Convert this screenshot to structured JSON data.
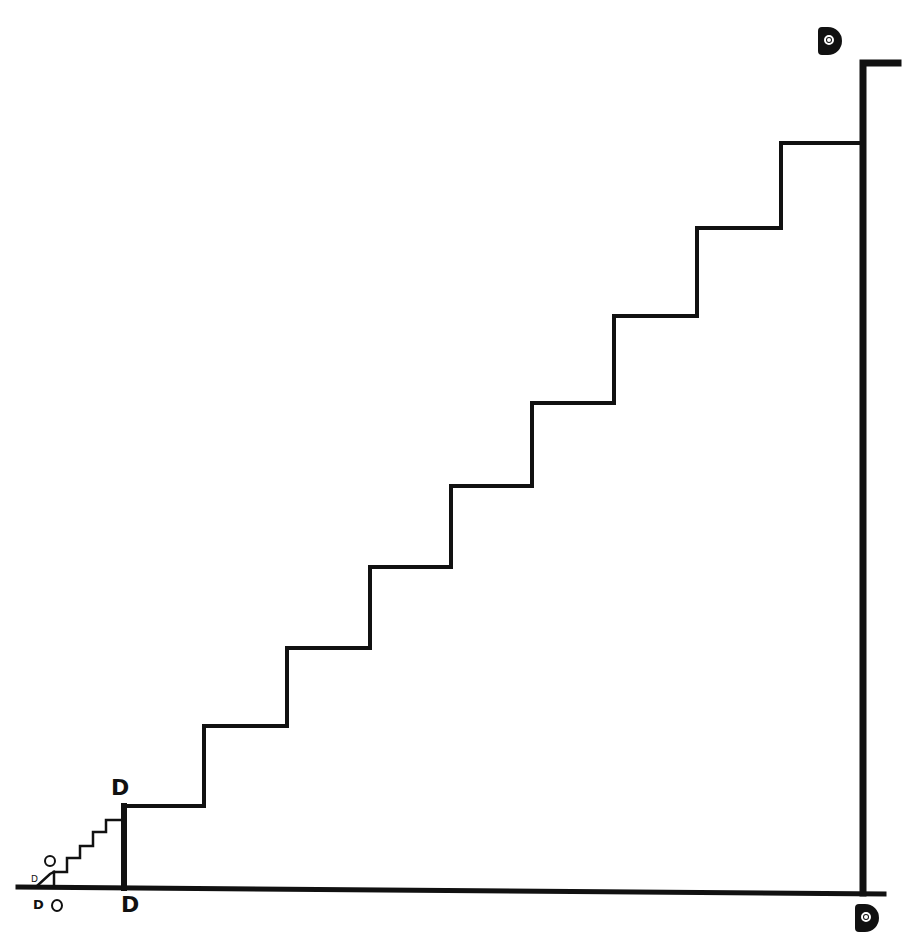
{
  "diagram": {
    "stroke_color": "#111111",
    "background": "#ffffff",
    "labels": {
      "big_stair_top": "D",
      "big_stair_base": "D",
      "small_stair_figure": "O",
      "small_stair_tiny": "D",
      "bottom_left_d": "D",
      "bottom_left_o": "O",
      "tall_wall_top": "D",
      "tall_wall_base": "D"
    },
    "baseline": {
      "x1": 18,
      "y1": 887,
      "x2": 884,
      "y2": 894
    },
    "large_staircase": {
      "step_count": 9,
      "points": [
        [
          124,
          888
        ],
        [
          124,
          806
        ],
        [
          204,
          806
        ],
        [
          204,
          726
        ],
        [
          287,
          726
        ],
        [
          287,
          648
        ],
        [
          370,
          648
        ],
        [
          370,
          567
        ],
        [
          451,
          567
        ],
        [
          451,
          486
        ],
        [
          532,
          486
        ],
        [
          532,
          403
        ],
        [
          614,
          403
        ],
        [
          614,
          316
        ],
        [
          697,
          316
        ],
        [
          697,
          228
        ],
        [
          781,
          228
        ],
        [
          781,
          143
        ],
        [
          863,
          143
        ]
      ]
    },
    "small_staircase": {
      "step_count": 5,
      "ramp": [
        [
          37,
          886
        ],
        [
          50,
          874
        ],
        [
          54,
          872
        ]
      ],
      "riser_post": [
        [
          54,
          887
        ],
        [
          54,
          872
        ]
      ],
      "points": [
        [
          54,
          872
        ],
        [
          67,
          872
        ],
        [
          67,
          858
        ],
        [
          80,
          858
        ],
        [
          80,
          846
        ],
        [
          93,
          846
        ],
        [
          93,
          832
        ],
        [
          106,
          832
        ],
        [
          106,
          820
        ],
        [
          122,
          820
        ]
      ]
    },
    "tall_wall": {
      "points": [
        [
          863,
          893
        ],
        [
          863,
          63
        ],
        [
          898,
          63
        ]
      ]
    }
  }
}
